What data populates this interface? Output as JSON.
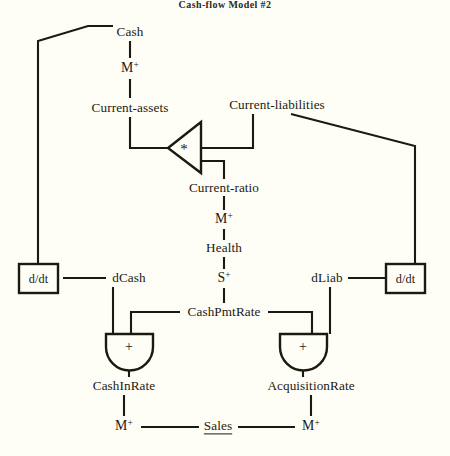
{
  "title": "Cash-flow Model #2",
  "background_color": "#fffef6",
  "ink_color": "#1a1a14",
  "diagram": {
    "type": "qualitative-causal-graph",
    "nodes": {
      "cash": "Cash",
      "current_assets": "Current-assets",
      "current_liabilities": "Current-liabilities",
      "current_ratio": "Current-ratio",
      "health": "Health",
      "d_cash": "dCash",
      "d_liab": "dLiab",
      "cash_pmt_rate": "CashPmtRate",
      "cash_in_rate": "CashInRate",
      "acquisition_rate": "AcquisitionRate",
      "sales": "Sales"
    },
    "operators": {
      "derivative_left": "d/dt",
      "derivative_right": "d/dt",
      "multiplier": "*",
      "adder_left": "+",
      "adder_right": "+"
    },
    "influences": {
      "cash_to_current_assets": "M",
      "cash_to_current_assets_sign": "+",
      "current_ratio_to_health": "M",
      "current_ratio_to_health_sign": "+",
      "health_to_cash_pmt_rate": "S",
      "health_to_cash_pmt_rate_sign": "+",
      "sales_to_cash_in_rate": "M",
      "sales_to_cash_in_rate_sign": "+",
      "sales_to_acquisition_rate": "M",
      "sales_to_acquisition_rate_sign": "+"
    },
    "labels": [
      {
        "id": "title",
        "text": "Cash-flow Model #2",
        "x": 225,
        "y": 5,
        "kind": "title"
      },
      {
        "id": "cash",
        "text": "Cash",
        "x": 130,
        "y": 32,
        "kind": "node"
      },
      {
        "id": "m1",
        "text": "M",
        "sup": "+",
        "x": 130,
        "y": 68,
        "kind": "qual"
      },
      {
        "id": "current-assets",
        "text": "Current-assets",
        "x": 130,
        "y": 108,
        "kind": "node"
      },
      {
        "id": "current-liabilities",
        "text": "Current-liabilities",
        "x": 277,
        "y": 105,
        "kind": "node"
      },
      {
        "id": "multiplier",
        "text": "*",
        "x": 184,
        "y": 148,
        "kind": "star"
      },
      {
        "id": "current-ratio",
        "text": "Current-ratio",
        "x": 224,
        "y": 188,
        "kind": "node"
      },
      {
        "id": "m2",
        "text": "M",
        "sup": "+",
        "x": 224,
        "y": 219,
        "kind": "qual"
      },
      {
        "id": "health",
        "text": "Health",
        "x": 224,
        "y": 248,
        "kind": "node"
      },
      {
        "id": "s1",
        "text": "S",
        "sup": "+",
        "x": 224,
        "y": 278,
        "kind": "qual"
      },
      {
        "id": "ddt-left",
        "text": "d/dt",
        "x": 38,
        "y": 278,
        "kind": "box"
      },
      {
        "id": "dcash",
        "text": "dCash",
        "x": 129,
        "y": 278,
        "kind": "node"
      },
      {
        "id": "dliab",
        "text": "dLiab",
        "x": 327,
        "y": 278,
        "kind": "node"
      },
      {
        "id": "ddt-right",
        "text": "d/dt",
        "x": 405,
        "y": 278,
        "kind": "box"
      },
      {
        "id": "cash-pmt-rate",
        "text": "CashPmtRate",
        "x": 224,
        "y": 312,
        "kind": "node"
      },
      {
        "id": "adder-left",
        "text": "+",
        "x": 129,
        "y": 346,
        "kind": "plus"
      },
      {
        "id": "adder-right",
        "text": "+",
        "x": 303,
        "y": 346,
        "kind": "plus"
      },
      {
        "id": "cash-in-rate",
        "text": "CashInRate",
        "x": 124,
        "y": 386,
        "kind": "node"
      },
      {
        "id": "acquisition-rate",
        "text": "AcquisitionRate",
        "x": 311,
        "y": 386,
        "kind": "node"
      },
      {
        "id": "m3",
        "text": "M",
        "sup": "+",
        "x": 124,
        "y": 426,
        "kind": "qual"
      },
      {
        "id": "sales",
        "text": "Sales",
        "x": 218,
        "y": 426,
        "kind": "node-underlined"
      },
      {
        "id": "m4",
        "text": "M",
        "sup": "+",
        "x": 311,
        "y": 426,
        "kind": "qual"
      }
    ]
  }
}
